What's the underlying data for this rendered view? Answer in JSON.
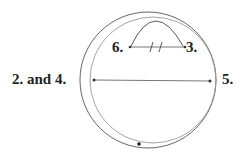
{
  "diagram": {
    "type": "geometric-construction",
    "labels": {
      "left": "2. and 4.",
      "right": "5.",
      "top_left": "6.",
      "top_right": "3."
    },
    "colors": {
      "ink": "#222222",
      "line": "#555555",
      "faint_line": "#9a9a9a"
    },
    "elements": [
      {
        "kind": "circle",
        "role": "main-circle"
      },
      {
        "kind": "circle",
        "role": "offset-circle"
      },
      {
        "kind": "arc",
        "role": "upper-arc",
        "from": "6.",
        "to": "3."
      },
      {
        "kind": "segment",
        "role": "horizontal-diameter",
        "from": "2. and 4.",
        "to": "5."
      },
      {
        "kind": "segment",
        "role": "chord-with-tick-marks",
        "from": "6.",
        "to": "3.",
        "tick_marks": 2
      },
      {
        "kind": "point",
        "role": "bottom-point"
      }
    ]
  }
}
